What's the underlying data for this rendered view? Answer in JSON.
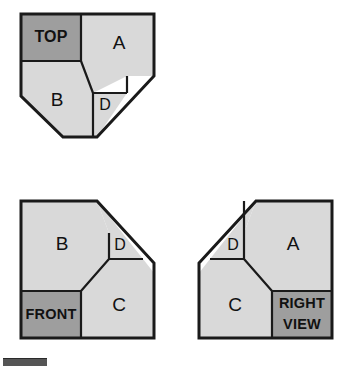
{
  "document": {
    "kind": "orthographic-projection-diagram",
    "background_color": "#ffffff",
    "canvas": {
      "width": 354,
      "height": 371
    }
  },
  "palette": {
    "face_light": "#d9d9d9",
    "face_dark": "#9e9e9e",
    "outline": "#1a1a1a",
    "label_text": "#111111",
    "footer_bar": "#555555"
  },
  "views": [
    {
      "id": "top-view",
      "name": "Top View",
      "position": {
        "x": 21,
        "y": 14
      },
      "size": {
        "width": 133,
        "height": 137
      },
      "outline_points": "0,0 133,0 133,62 76,123 42,123 0,82 0,0",
      "faces": [
        {
          "id": "top-view-face-top",
          "label": "TOP",
          "label_kind": "word",
          "shade": "dark",
          "points": "0,0 60,0 60,47 0,47",
          "label_pos": {
            "x": 30,
            "y": 24
          }
        },
        {
          "id": "top-view-face-a",
          "label": "A",
          "label_kind": "letter",
          "shade": "light",
          "points": "60,0 133,0 133,62 106,62 72,79 60,47",
          "label_pos": {
            "x": 98,
            "y": 30
          }
        },
        {
          "id": "top-view-face-b",
          "label": "B",
          "label_kind": "letter",
          "shade": "light",
          "points": "0,47 60,47 72,79 72,123 42,123 0,82",
          "label_pos": {
            "x": 36,
            "y": 87
          }
        },
        {
          "id": "top-view-face-d",
          "label": "D",
          "label_kind": "letter-sm",
          "shade": "light",
          "points": "72,79 106,79 76,123 72,123",
          "label_pos": {
            "x": 84,
            "y": 92
          }
        }
      ],
      "internal_edges": [
        "60,0 60,47",
        "0,47 60,47",
        "60,47 72,79",
        "72,79 106,79",
        "106,62 106,79",
        "72,79 72,123"
      ]
    },
    {
      "id": "front-view",
      "name": "Front View",
      "position": {
        "x": 21,
        "y": 201
      },
      "size": {
        "width": 133,
        "height": 137
      },
      "outline_points": "0,0 76,0 133,62 133,137 0,137 0,0",
      "faces": [
        {
          "id": "front-view-face-b",
          "label": "B",
          "label_kind": "letter",
          "shade": "light",
          "points": "0,0 76,0 88,32 88,58 60,90 0,90",
          "label_pos": {
            "x": 41,
            "y": 44
          }
        },
        {
          "id": "front-view-face-d",
          "label": "D",
          "label_kind": "letter-sm",
          "shade": "light",
          "points": "76,0 122,58 88,58 88,32",
          "label_pos": {
            "x": 99,
            "y": 45
          }
        },
        {
          "id": "front-view-face-front",
          "label": "FRONT",
          "label_kind": "word-sm",
          "shade": "dark",
          "points": "0,90 60,90 60,137 0,137",
          "label_pos": {
            "x": 30,
            "y": 114
          }
        },
        {
          "id": "front-view-face-c",
          "label": "C",
          "label_kind": "letter",
          "shade": "light",
          "points": "88,58 122,58 133,72 133,137 60,137 60,90",
          "label_pos": {
            "x": 98,
            "y": 105
          }
        }
      ],
      "internal_edges": [
        "88,32 88,58",
        "88,58 122,58",
        "60,90 88,58",
        "0,90 60,90",
        "60,90 60,137"
      ]
    },
    {
      "id": "right-view",
      "name": "Right Side View",
      "position": {
        "x": 199,
        "y": 201
      },
      "size": {
        "width": 133,
        "height": 137
      },
      "outline_points": "57,0 133,0 133,137 0,137 0,62 57,0",
      "faces": [
        {
          "id": "right-view-face-d",
          "label": "D",
          "label_kind": "letter-sm",
          "shade": "light",
          "points": "57,0 11,58 45,58 45,32",
          "label_pos": {
            "x": 34,
            "y": 45
          }
        },
        {
          "id": "right-view-face-a",
          "label": "A",
          "label_kind": "letter",
          "shade": "light",
          "points": "57,0 133,0 133,90 73,90 45,58 45,32",
          "label_pos": {
            "x": 94,
            "y": 44
          }
        },
        {
          "id": "right-view-face-c",
          "label": "C",
          "label_kind": "letter",
          "shade": "light",
          "points": "11,58 45,58 73,90 73,137 0,137 0,72",
          "label_pos": {
            "x": 36,
            "y": 105
          }
        },
        {
          "id": "right-view-face-right",
          "label_lines": [
            "RIGHT",
            "VIEW"
          ],
          "label_kind": "word-sm",
          "shade": "dark",
          "points": "73,90 133,90 133,137 73,137",
          "label_pos": {
            "x": 103,
            "y": 113
          }
        }
      ],
      "internal_edges": [
        "45,0 45,32",
        "45,32 45,58",
        "11,58 45,58",
        "45,58 73,90",
        "73,90 133,90",
        "73,90 73,137"
      ]
    }
  ],
  "footer": {
    "id": "footer-bar",
    "name": "page-marker-bar",
    "color": "#555555"
  }
}
